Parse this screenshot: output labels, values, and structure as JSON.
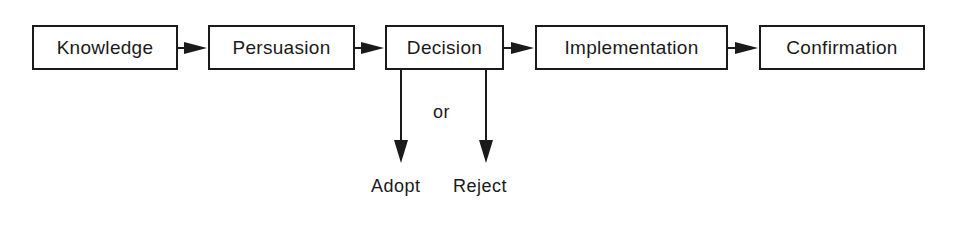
{
  "diagram": {
    "stages": [
      {
        "label": "Knowledge"
      },
      {
        "label": "Persuasion"
      },
      {
        "label": "Decision"
      },
      {
        "label": "Implementation"
      },
      {
        "label": "Confirmation"
      }
    ],
    "decision_branch": {
      "connector": "or",
      "outcomes": [
        "Adopt",
        "Reject"
      ]
    },
    "colors": {
      "stroke": "#1a1a1a",
      "background": "#ffffff"
    }
  }
}
